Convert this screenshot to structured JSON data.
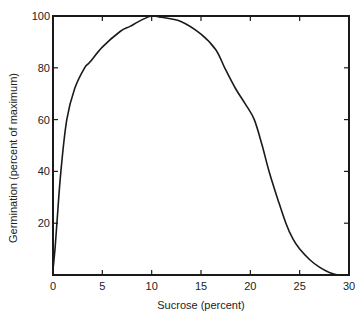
{
  "chart_data": {
    "type": "line",
    "title": "",
    "xlabel": "Sucrose (percent)",
    "ylabel": "Germination (percent of maximum)",
    "xlim": [
      0,
      30
    ],
    "ylim": [
      0,
      100
    ],
    "xticks": [
      0,
      5,
      10,
      15,
      20,
      25,
      30
    ],
    "yticks": [
      20,
      40,
      60,
      80,
      100
    ],
    "grid": false,
    "legend": null,
    "series": [
      {
        "name": "Germination",
        "x": [
          0,
          0.2,
          0.4,
          0.8,
          1.4,
          2.2,
          3.2,
          3.7,
          5,
          6.8,
          7.8,
          9,
          10,
          11,
          12.9,
          15,
          16.5,
          17.4,
          18.5,
          19.5,
          20.4,
          21.2,
          21.9,
          22.8,
          23.6,
          24.3,
          25,
          26,
          27,
          28,
          28.9,
          29.5
        ],
        "y": [
          2,
          10,
          20,
          40,
          60,
          72,
          80,
          82,
          88,
          94,
          96,
          98.5,
          100,
          99.5,
          98,
          93,
          87,
          80,
          72,
          66,
          60,
          50,
          40,
          29,
          20,
          14,
          10,
          6,
          3,
          1,
          0,
          0
        ]
      }
    ]
  },
  "axes": {
    "x_tick_labels": [
      "0",
      "5",
      "10",
      "15",
      "20",
      "25",
      "30"
    ],
    "y_tick_labels": [
      "20",
      "40",
      "60",
      "80",
      "100"
    ],
    "x_title": "Sucrose (percent)",
    "y_title": "Germination (percent of maximum)"
  },
  "colors": {
    "line": "#1a1a1a",
    "axis": "#1a1a1a",
    "background": "#ffffff"
  }
}
